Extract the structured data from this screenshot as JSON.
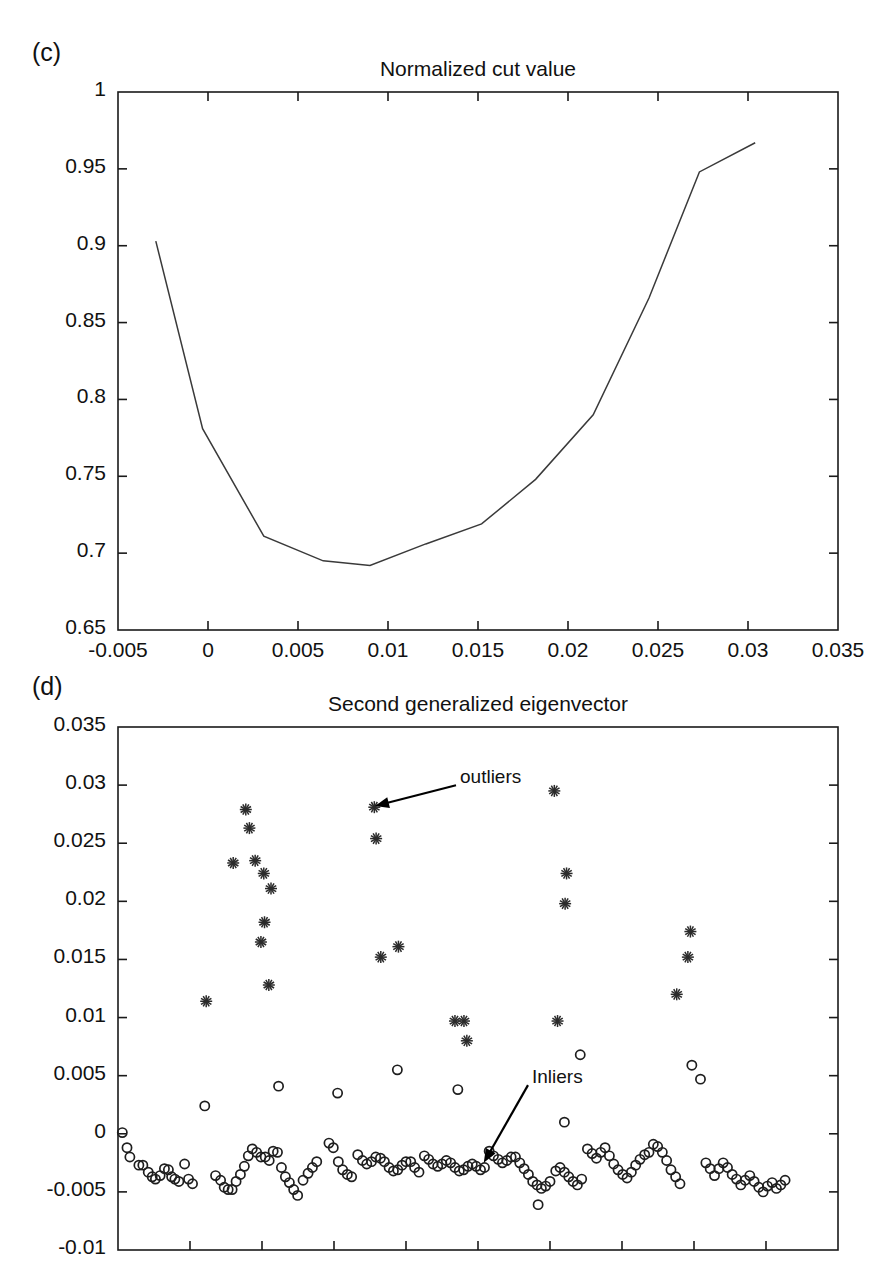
{
  "figure": {
    "panels": [
      {
        "label": "(c)",
        "title": "Normalized cut value",
        "plot_box": {
          "x": 118,
          "y": 92,
          "width": 720,
          "height": 538
        }
      },
      {
        "label": "(d)",
        "title": "Second generalized eigenvector",
        "plot_box": {
          "x": 118,
          "y": 727,
          "width": 720,
          "height": 523
        }
      }
    ]
  },
  "chart_data": [
    {
      "type": "line",
      "panel": "(c)",
      "title": "Normalized cut value",
      "xlabel": "",
      "ylabel": "",
      "xlim": [
        -0.005,
        0.035
      ],
      "ylim": [
        0.65,
        1.0
      ],
      "xticks": [
        -0.005,
        0,
        0.005,
        0.01,
        0.015,
        0.02,
        0.025,
        0.03,
        0.035
      ],
      "xtick_labels": [
        "-0.005",
        "0",
        "0.005",
        "0.01",
        "0.015",
        "0.02",
        "0.025",
        "0.03",
        "0.035"
      ],
      "yticks": [
        0.65,
        0.7,
        0.75,
        0.8,
        0.85,
        0.9,
        0.95,
        1
      ],
      "ytick_labels": [
        "0.65",
        "0.7",
        "0.75",
        "0.8",
        "0.85",
        "0.9",
        "0.95",
        "1"
      ],
      "grid": false,
      "legend": "none",
      "x": [
        -0.0029,
        -0.0003,
        0.0031,
        0.0064,
        0.009,
        0.0121,
        0.0152,
        0.0182,
        0.0214,
        0.0245,
        0.0273,
        0.0304
      ],
      "y": [
        0.903,
        0.781,
        0.711,
        0.695,
        0.692,
        0.706,
        0.719,
        0.748,
        0.79,
        0.866,
        0.948,
        0.967
      ]
    },
    {
      "type": "scatter",
      "panel": "(d)",
      "title": "Second generalized eigenvector",
      "xlabel": "",
      "ylabel": "",
      "xlim": [
        0,
        1
      ],
      "ylim": [
        -0.01,
        0.035
      ],
      "yticks": [
        -0.01,
        -0.005,
        0,
        0.005,
        0.01,
        0.015,
        0.02,
        0.025,
        0.03,
        0.035
      ],
      "ytick_labels": [
        "-0.01",
        "-0.005",
        "0",
        "0.005",
        "0.01",
        "0.015",
        "0.02",
        "0.025",
        "0.03",
        "0.035"
      ],
      "xticks": [
        0.1,
        0.2,
        0.3,
        0.4,
        0.5,
        0.6,
        0.7,
        0.8,
        0.9,
        1.0
      ],
      "xtick_labels": [],
      "grid": false,
      "legend": "none",
      "annotations": [
        {
          "text": "outliers",
          "label_x": 0.475,
          "label_y": 0.0305,
          "point_x": 0.357,
          "point_y": 0.0282
        },
        {
          "text": "Inliers",
          "label_x": 0.575,
          "label_y": 0.0047,
          "point_x": 0.508,
          "point_y": -0.0025
        }
      ],
      "series": [
        {
          "name": "outliers",
          "marker": "star",
          "points": [
            [
              0.1225,
              0.0114
            ],
            [
              0.1775,
              0.0279
            ],
            [
              0.1825,
              0.0263
            ],
            [
              0.16,
              0.0233
            ],
            [
              0.1905,
              0.0235
            ],
            [
              0.2025,
              0.0224
            ],
            [
              0.2125,
              0.0211
            ],
            [
              0.2035,
              0.0182
            ],
            [
              0.1985,
              0.0165
            ],
            [
              0.2095,
              0.0128
            ],
            [
              0.356,
              0.0281
            ],
            [
              0.3585,
              0.0254
            ],
            [
              0.3895,
              0.0161
            ],
            [
              0.365,
              0.0152
            ],
            [
              0.468,
              0.0097
            ],
            [
              0.4805,
              0.0097
            ],
            [
              0.4845,
              0.008
            ],
            [
              0.606,
              0.0295
            ],
            [
              0.623,
              0.0224
            ],
            [
              0.621,
              0.0198
            ],
            [
              0.6105,
              0.0097
            ],
            [
              0.795,
              0.0174
            ],
            [
              0.7915,
              0.0152
            ],
            [
              0.776,
              0.012
            ]
          ]
        },
        {
          "name": "inliers",
          "marker": "circle",
          "points": [
            [
              0.006,
              0.0001
            ],
            [
              0.0125,
              -0.0012
            ],
            [
              0.0165,
              -0.002
            ],
            [
              0.029,
              -0.0027
            ],
            [
              0.0345,
              -0.0027
            ],
            [
              0.042,
              -0.0033
            ],
            [
              0.0475,
              -0.0037
            ],
            [
              0.052,
              -0.0039
            ],
            [
              0.0585,
              -0.0036
            ],
            [
              0.0645,
              -0.003
            ],
            [
              0.07,
              -0.0031
            ],
            [
              0.0745,
              -0.0037
            ],
            [
              0.079,
              -0.0039
            ],
            [
              0.0845,
              -0.0041
            ],
            [
              0.0925,
              -0.0026
            ],
            [
              0.098,
              -0.0039
            ],
            [
              0.1035,
              -0.0043
            ],
            [
              0.1205,
              0.0024
            ],
            [
              0.1355,
              -0.0036
            ],
            [
              0.1425,
              -0.004
            ],
            [
              0.1475,
              -0.0046
            ],
            [
              0.153,
              -0.0048
            ],
            [
              0.1585,
              -0.0048
            ],
            [
              0.164,
              -0.0041
            ],
            [
              0.17,
              -0.0035
            ],
            [
              0.1755,
              -0.0028
            ],
            [
              0.181,
              -0.0019
            ],
            [
              0.1865,
              -0.0013
            ],
            [
              0.1925,
              -0.0016
            ],
            [
              0.1985,
              -0.002
            ],
            [
              0.2045,
              -0.002
            ],
            [
              0.21,
              -0.0023
            ],
            [
              0.2155,
              -0.0015
            ],
            [
              0.2215,
              -0.0016
            ],
            [
              0.227,
              -0.0029
            ],
            [
              0.2325,
              -0.0037
            ],
            [
              0.238,
              -0.0042
            ],
            [
              0.244,
              -0.0048
            ],
            [
              0.2495,
              -0.0053
            ],
            [
              0.223,
              0.0041
            ],
            [
              0.257,
              -0.004
            ],
            [
              0.264,
              -0.0034
            ],
            [
              0.27,
              -0.0029
            ],
            [
              0.276,
              -0.0024
            ],
            [
              0.293,
              -0.0008
            ],
            [
              0.299,
              -0.0012
            ],
            [
              0.306,
              -0.0024
            ],
            [
              0.312,
              -0.0031
            ],
            [
              0.3185,
              -0.0035
            ],
            [
              0.3245,
              -0.0037
            ],
            [
              0.305,
              0.0035
            ],
            [
              0.333,
              -0.0018
            ],
            [
              0.3395,
              -0.0023
            ],
            [
              0.3455,
              -0.0026
            ],
            [
              0.352,
              -0.0024
            ],
            [
              0.358,
              -0.002
            ],
            [
              0.3645,
              -0.0021
            ],
            [
              0.37,
              -0.0024
            ],
            [
              0.3765,
              -0.0029
            ],
            [
              0.3825,
              -0.0032
            ],
            [
              0.3885,
              -0.0031
            ],
            [
              0.3945,
              -0.0027
            ],
            [
              0.4,
              -0.0024
            ],
            [
              0.4065,
              -0.0024
            ],
            [
              0.412,
              -0.0029
            ],
            [
              0.418,
              -0.0033
            ],
            [
              0.388,
              0.0055
            ],
            [
              0.4255,
              -0.0019
            ],
            [
              0.4315,
              -0.0022
            ],
            [
              0.4375,
              -0.0026
            ],
            [
              0.444,
              -0.0028
            ],
            [
              0.45,
              -0.0026
            ],
            [
              0.456,
              -0.0023
            ],
            [
              0.462,
              -0.0025
            ],
            [
              0.468,
              -0.0029
            ],
            [
              0.474,
              -0.0032
            ],
            [
              0.48,
              -0.0031
            ],
            [
              0.486,
              -0.0028
            ],
            [
              0.492,
              -0.0026
            ],
            [
              0.4975,
              -0.0028
            ],
            [
              0.5035,
              -0.0031
            ],
            [
              0.509,
              -0.0029
            ],
            [
              0.472,
              0.0038
            ],
            [
              0.5155,
              -0.0015
            ],
            [
              0.5215,
              -0.0019
            ],
            [
              0.528,
              -0.0022
            ],
            [
              0.534,
              -0.0025
            ],
            [
              0.54,
              -0.0023
            ],
            [
              0.546,
              -0.002
            ],
            [
              0.552,
              -0.002
            ],
            [
              0.558,
              -0.0025
            ],
            [
              0.564,
              -0.003
            ],
            [
              0.57,
              -0.0035
            ],
            [
              0.576,
              -0.0041
            ],
            [
              0.582,
              -0.0044
            ],
            [
              0.588,
              -0.0047
            ],
            [
              0.594,
              -0.0045
            ],
            [
              0.6,
              -0.0041
            ],
            [
              0.5835,
              -0.0061
            ],
            [
              0.608,
              -0.0032
            ],
            [
              0.614,
              -0.0029
            ],
            [
              0.62,
              -0.0033
            ],
            [
              0.626,
              -0.0037
            ],
            [
              0.632,
              -0.0041
            ],
            [
              0.638,
              -0.0044
            ],
            [
              0.644,
              -0.0039
            ],
            [
              0.62,
              0.001
            ],
            [
              0.642,
              0.0068
            ],
            [
              0.652,
              -0.0013
            ],
            [
              0.6585,
              -0.0017
            ],
            [
              0.6645,
              -0.0021
            ],
            [
              0.6705,
              -0.0016
            ],
            [
              0.6765,
              -0.0012
            ],
            [
              0.6825,
              -0.0019
            ],
            [
              0.6885,
              -0.0026
            ],
            [
              0.6945,
              -0.0031
            ],
            [
              0.701,
              -0.0035
            ],
            [
              0.707,
              -0.0038
            ],
            [
              0.713,
              -0.0033
            ],
            [
              0.719,
              -0.0027
            ],
            [
              0.725,
              -0.0022
            ],
            [
              0.7315,
              -0.0018
            ],
            [
              0.7375,
              -0.0016
            ],
            [
              0.7435,
              -0.0009
            ],
            [
              0.7495,
              -0.0011
            ],
            [
              0.756,
              -0.0016
            ],
            [
              0.762,
              -0.0023
            ],
            [
              0.768,
              -0.0031
            ],
            [
              0.7745,
              -0.0037
            ],
            [
              0.7805,
              -0.0043
            ],
            [
              0.797,
              0.0059
            ],
            [
              0.809,
              0.0047
            ],
            [
              0.8165,
              -0.0025
            ],
            [
              0.8225,
              -0.003
            ],
            [
              0.8285,
              -0.0036
            ],
            [
              0.8345,
              -0.003
            ],
            [
              0.8405,
              -0.0025
            ],
            [
              0.8465,
              -0.0029
            ],
            [
              0.853,
              -0.0035
            ],
            [
              0.859,
              -0.0039
            ],
            [
              0.865,
              -0.0044
            ],
            [
              0.871,
              -0.004
            ],
            [
              0.8775,
              -0.0036
            ],
            [
              0.8835,
              -0.0041
            ],
            [
              0.89,
              -0.0046
            ],
            [
              0.896,
              -0.005
            ],
            [
              0.902,
              -0.0045
            ],
            [
              0.9085,
              -0.0042
            ],
            [
              0.9145,
              -0.0047
            ],
            [
              0.9205,
              -0.0044
            ],
            [
              0.9265,
              -0.004
            ]
          ]
        }
      ]
    }
  ]
}
